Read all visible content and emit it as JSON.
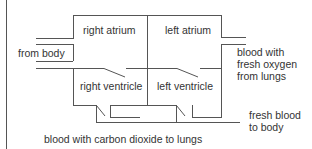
{
  "diagram": {
    "type": "heart-circulation-schematic",
    "chambers": {
      "right_atrium": "right atrium",
      "left_atrium": "left atrium",
      "right_ventricle": "right ventricle",
      "left_ventricle": "left ventricle"
    },
    "flows": {
      "from_body": "from body",
      "from_lungs_line1": "blood with",
      "from_lungs_line2": "fresh oxygen",
      "from_lungs_line3": "from lungs",
      "to_body_line1": "fresh blood",
      "to_body_line2": "to body",
      "to_lungs": "blood with carbon dioxide to lungs"
    },
    "colors": {
      "line": "#555555",
      "text": "#333333",
      "background": "#ffffff"
    }
  }
}
